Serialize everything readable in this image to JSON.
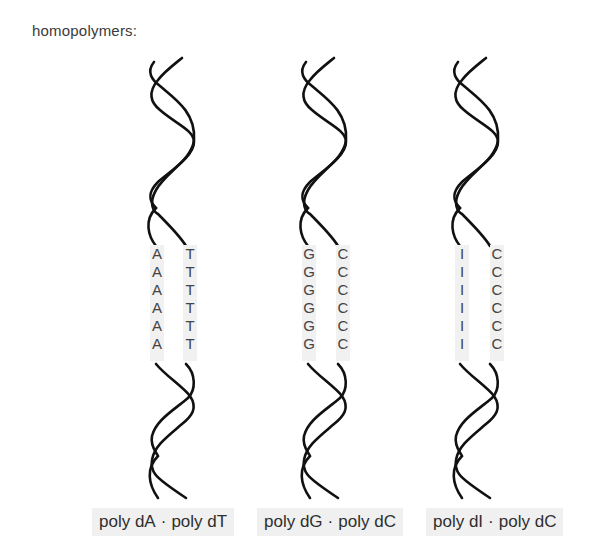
{
  "title": "homopolymers:",
  "strand_color": "#111111",
  "label_bg": "#f0f0f0",
  "duplexes": [
    {
      "left_base": "A",
      "right_base": "T",
      "left_bases": [
        "A",
        "A",
        "A",
        "A",
        "A",
        "A"
      ],
      "right_bases": [
        "T",
        "T",
        "T",
        "T",
        "T",
        "T"
      ],
      "label_left": "poly dA",
      "separator": "·",
      "label_right": "poly dT"
    },
    {
      "left_base": "G",
      "right_base": "C",
      "left_bases": [
        "G",
        "G",
        "G",
        "G",
        "G",
        "G"
      ],
      "right_bases": [
        "C",
        "C",
        "C",
        "C",
        "C",
        "C"
      ],
      "label_left": "poly dG",
      "separator": "·",
      "label_right": "poly dC"
    },
    {
      "left_base": "I",
      "right_base": "C",
      "left_bases": [
        "I",
        "I",
        "I",
        "I",
        "I",
        "I"
      ],
      "right_bases": [
        "C",
        "C",
        "C",
        "C",
        "C",
        "C"
      ],
      "label_left": "poly dI",
      "separator": "·",
      "label_right": "poly dC"
    }
  ]
}
